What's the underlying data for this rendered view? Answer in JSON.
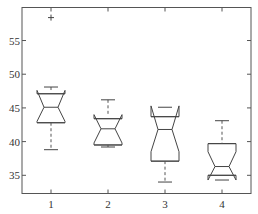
{
  "chart_data": {
    "type": "boxplot",
    "title": "",
    "xlabel": "",
    "ylabel": "",
    "categories": [
      "1",
      "2",
      "3",
      "4"
    ],
    "ylim": [
      32.3,
      59.9
    ],
    "yticks": [
      35,
      40,
      45,
      50,
      55
    ],
    "ytick_labels": [
      "35",
      "40",
      "45",
      "50",
      "55"
    ],
    "xtick_labels": [
      "1",
      "2",
      "3",
      "4"
    ],
    "grid": false,
    "notched": true,
    "boxes": [
      {
        "label": "1",
        "lower_whisker": 38.8,
        "q1": 42.8,
        "median": 45.1,
        "q3": 47.1,
        "upper_whisker": 48.1,
        "notch_low": 43.0,
        "notch_high": 47.6,
        "outliers": [
          58.4
        ]
      },
      {
        "label": "2",
        "lower_whisker": 39.2,
        "q1": 39.5,
        "median": 41.9,
        "q3": 43.4,
        "upper_whisker": 46.2,
        "notch_low": 39.8,
        "notch_high": 44.0,
        "outliers": []
      },
      {
        "label": "3",
        "lower_whisker": 34.0,
        "q1": 37.1,
        "median": 41.8,
        "q3": 43.7,
        "upper_whisker": 45.1,
        "notch_low": 38.5,
        "notch_high": 45.3,
        "outliers": []
      },
      {
        "label": "4",
        "lower_whisker": 34.3,
        "q1": 35.0,
        "median": 36.3,
        "q3": 39.7,
        "upper_whisker": 43.1,
        "notch_low": 34.3,
        "notch_high": 38.5,
        "outliers": []
      }
    ]
  },
  "colors": {
    "box": "#444444",
    "axis": "#555555",
    "text": "#333333",
    "background": "#ffffff"
  },
  "icons": {
    "outlier_marker": "+"
  }
}
